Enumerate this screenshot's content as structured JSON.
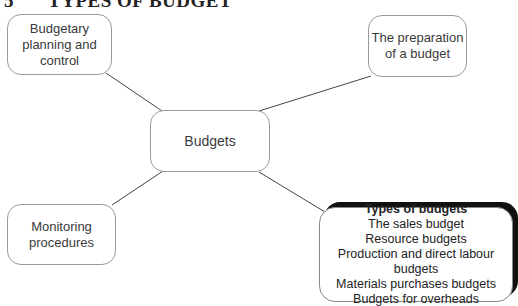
{
  "header": {
    "section_number": "5",
    "title": "TYPES OF BUDGET"
  },
  "diagram": {
    "center": {
      "label": "Budgets"
    },
    "nodes": {
      "top_left": {
        "label": "Budgetary planning and control"
      },
      "top_right": {
        "label": "The preparation of a budget"
      },
      "bottom_left": {
        "label": "Monitoring procedures"
      },
      "bottom_right": {
        "heading": "Types of budgets",
        "items": [
          "The sales budget",
          "Resource budgets",
          "Production and direct labour budgets",
          "Materials purchases budgets",
          "Budgets for overheads"
        ]
      }
    },
    "colors": {
      "line": "#444444",
      "border": "#9a9a9a",
      "shadow": "#111111"
    }
  }
}
